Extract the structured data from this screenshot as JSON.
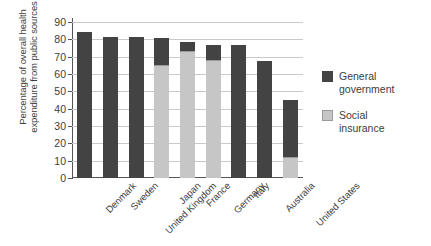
{
  "chart_data": {
    "type": "bar",
    "stacked": true,
    "title": "",
    "xlabel": "",
    "ylabel": "Percentage of overall health expenditure from public sources",
    "ylim": [
      0,
      90
    ],
    "ytick_step": 10,
    "yticks": [
      90,
      80,
      70,
      60,
      50,
      40,
      30,
      20,
      10,
      0
    ],
    "grid": true,
    "legend_position": "right",
    "categories": [
      "Denmark",
      "Sweden",
      "United Kingdom",
      "Japan",
      "France",
      "Germany",
      "Italy",
      "Australia",
      "United States"
    ],
    "series": [
      {
        "name": "Social insurance",
        "color": "#c6c6c6",
        "values": [
          0,
          0,
          0,
          65,
          73.5,
          68,
          0,
          0,
          12
        ]
      },
      {
        "name": "General government",
        "color": "#434343",
        "values": [
          84,
          81.5,
          81.5,
          16,
          5,
          8.5,
          76.5,
          67.5,
          33
        ]
      }
    ],
    "totals": [
      84,
      81.5,
      81.5,
      81,
      78.5,
      76.5,
      76.5,
      67.5,
      45
    ]
  },
  "axis": {
    "y_title_line1": "Percentage of overall health",
    "y_title_line2": "expenditure from public sources"
  },
  "legend": {
    "entries": [
      {
        "label_line1": "General",
        "label_line2": "government",
        "swatch": "dark-grey-swatch"
      },
      {
        "label_line1": "Social",
        "label_line2": "insurance",
        "swatch": "light-grey-swatch"
      }
    ]
  }
}
